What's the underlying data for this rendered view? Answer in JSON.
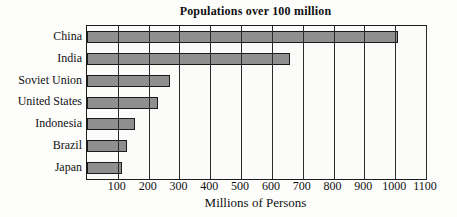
{
  "figure": {
    "title": "Populations over 100 million",
    "x_axis_label": "Millions of Persons"
  },
  "chart_data": {
    "type": "bar",
    "orientation": "horizontal",
    "title": "Populations over 100 million",
    "xlabel": "Millions of Persons",
    "ylabel": "",
    "categories": [
      "China",
      "India",
      "Soviet Union",
      "United States",
      "Indonesia",
      "Brazil",
      "Japan"
    ],
    "values": [
      1010,
      660,
      270,
      230,
      155,
      130,
      115
    ],
    "xlim": [
      0,
      1100
    ],
    "xticks": [
      100,
      200,
      300,
      400,
      500,
      600,
      700,
      800,
      900,
      1000,
      1100
    ],
    "grid": "vertical gridlines every 100, drawn over bars",
    "legend": "none",
    "bar_fill_color": "#8f8f8f",
    "bar_border_color": "#1b1b1b",
    "frame_color": "#1c1c1c",
    "background_color": "#fdfdfb"
  }
}
